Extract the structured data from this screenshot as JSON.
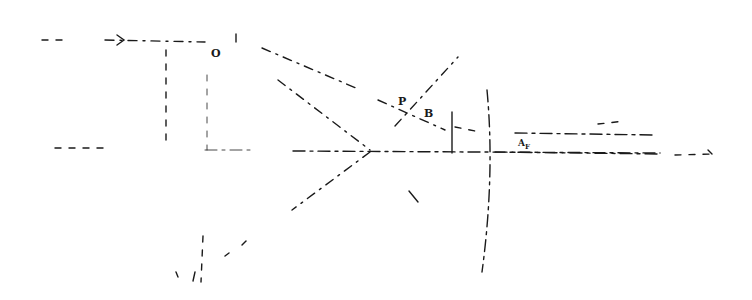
{
  "diagram": {
    "type": "optical ray diagram (hand-drawn, dashed lines)",
    "labels": {
      "origin": "O",
      "point_p": "P",
      "point_b": "B",
      "right_label": "A",
      "right_label_sub": "F"
    },
    "elements": [
      {
        "name": "incoming-ray-top",
        "description": "horizontal dashed ray with arrow pointing right at top-left"
      },
      {
        "name": "optical-axis",
        "description": "horizontal dash-dot axis across the middle"
      },
      {
        "name": "vertical-guide-left",
        "description": "vertical dashed line near x≈166"
      },
      {
        "name": "vertical-guide-center",
        "description": "vertical dashed line near x≈207"
      },
      {
        "name": "converging-rays",
        "description": "two diagonal rays converging to focal point near x≈370 on the axis"
      },
      {
        "name": "crossing-ray",
        "description": "diagonal ray from lower-left to upper-right crossing at point P"
      },
      {
        "name": "small-stop",
        "description": "short vertical aperture line near x≈452"
      },
      {
        "name": "curved-lens",
        "description": "tall curved lens outline near x≈485"
      },
      {
        "name": "output-rays",
        "description": "horizontal dashed rays exiting to the right"
      }
    ]
  }
}
